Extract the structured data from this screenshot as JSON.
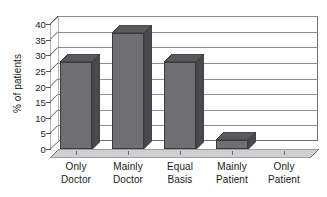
{
  "chart_data": {
    "type": "bar",
    "title": "",
    "subtitle": "",
    "xlabel": "",
    "ylabel": "% of patients",
    "categories": [
      "Only Doctor",
      "Mainly Doctor",
      "Equal Basis",
      "Mainly Patient",
      "Only Patient"
    ],
    "category_lines": [
      [
        "Only",
        "Doctor"
      ],
      [
        "Mainly",
        "Doctor"
      ],
      [
        "Equal",
        "Basis"
      ],
      [
        "Mainly",
        "Patient"
      ],
      [
        "Only",
        "Patient"
      ]
    ],
    "values": [
      28,
      37,
      28,
      3,
      0
    ],
    "ylim": [
      0,
      40
    ],
    "ytick_step": 5,
    "yticks": [
      0,
      5,
      10,
      15,
      20,
      25,
      30,
      35,
      40
    ],
    "ytick_labels": [
      "0",
      "5",
      "10",
      "15",
      "20",
      "25",
      "30",
      "35",
      "40"
    ],
    "grid": true,
    "legend": false,
    "legend_position": "none",
    "style": "3d-column",
    "colors": {
      "bar_front": "#6f6f73",
      "bar_side": "#4a4a4e",
      "bar_top": "#59595d",
      "bar_outline": "#3b3b3f",
      "gridline": "#8d8d91",
      "axis": "#56565a",
      "wall": "#ffffff",
      "floor": "#cfcfd2",
      "background": "#ffffff",
      "text": "#1a1a1a"
    }
  }
}
